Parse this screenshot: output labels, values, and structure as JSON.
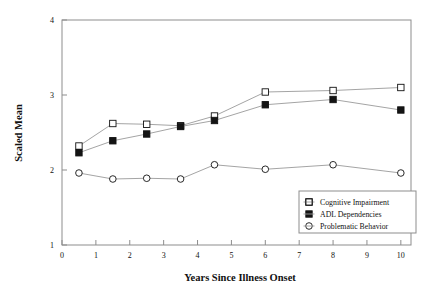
{
  "chart_data": {
    "type": "line",
    "title": "",
    "xlabel": "Years Since Illness Onset",
    "ylabel": "Scaled Mean",
    "xlim": [
      0,
      10.3
    ],
    "ylim": [
      1,
      4
    ],
    "xticks": [
      0,
      1,
      2,
      3,
      4,
      5,
      6,
      7,
      8,
      9,
      10
    ],
    "xtick_labels": [
      "0",
      "1",
      "2",
      "3",
      "4",
      "5",
      "6",
      "7",
      "8",
      "9",
      "10"
    ],
    "yticks": [
      1,
      2,
      3,
      4
    ],
    "ytick_labels": [
      "1",
      "2",
      "3",
      "4"
    ],
    "grid": false,
    "legend_position": "lower-right",
    "x": [
      0.5,
      1.5,
      2.5,
      3.5,
      4.5,
      6,
      8,
      10
    ],
    "series": [
      {
        "name": "Cognitive Impairment",
        "marker": "open-square",
        "values": [
          2.32,
          2.62,
          2.61,
          2.59,
          2.72,
          3.04,
          3.06,
          3.1
        ]
      },
      {
        "name": "ADL Dependencies",
        "marker": "filled-square",
        "values": [
          2.23,
          2.39,
          2.48,
          2.58,
          2.66,
          2.87,
          2.94,
          2.8
        ]
      },
      {
        "name": "Problematic Behavior",
        "marker": "open-circle",
        "values": [
          1.96,
          1.88,
          1.89,
          1.88,
          2.07,
          2.01,
          2.07,
          1.96
        ]
      }
    ]
  },
  "colors": {
    "line": "#9a9a9a",
    "marker_stroke": "#111111",
    "marker_fill_open": "#ffffff",
    "marker_fill_solid": "#141414",
    "axis": "#8d8d8d",
    "text": "#111111",
    "background": "#ffffff"
  }
}
